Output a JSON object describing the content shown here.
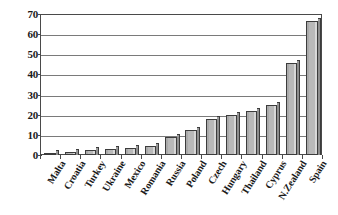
{
  "chart_data": {
    "type": "bar",
    "title": "",
    "subtitle": "",
    "xlabel": "",
    "ylabel": "",
    "ylim": [
      0,
      70
    ],
    "y_ticks": [
      0,
      10,
      20,
      30,
      40,
      50,
      60,
      70
    ],
    "grid": true,
    "legend": "none",
    "bar_color": "#b9b9b9",
    "bar_edge_color": "#3c3c3c",
    "categories": [
      "Malta",
      "Croatia",
      "Turkey",
      "Ukraine",
      "Mexico",
      "Romania",
      "Russia",
      "Poland",
      "Czech",
      "Hungary",
      "Thailand",
      "Cyprus",
      "N.Zealand",
      "Spain"
    ],
    "values": [
      1,
      1.5,
      2.5,
      3,
      3.5,
      4.5,
      9,
      12.5,
      18,
      20,
      22,
      25,
      45.5,
      66.5
    ]
  }
}
